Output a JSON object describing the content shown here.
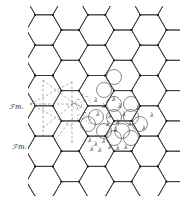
{
  "figure": {
    "type": "hexagonal lattice diagram",
    "orientation": "flat-top hexagons",
    "labels": {
      "upper_left": "ℱm.",
      "lower_left": "ℱm."
    },
    "marker_glyph": "λ",
    "colors": {
      "lattice": "#3a3a3a",
      "circles": "#555555",
      "dashed": "#777777",
      "background": "#ffffff"
    },
    "circle_centers": [
      [
        114,
        77
      ],
      [
        104,
        90
      ],
      [
        114,
        104
      ],
      [
        131,
        104
      ],
      [
        96,
        117
      ],
      [
        114,
        117
      ],
      [
        131,
        117
      ],
      [
        140,
        124
      ],
      [
        122,
        131
      ],
      [
        104,
        131
      ],
      [
        88,
        124
      ],
      [
        114,
        138
      ],
      [
        131,
        138
      ]
    ]
  }
}
